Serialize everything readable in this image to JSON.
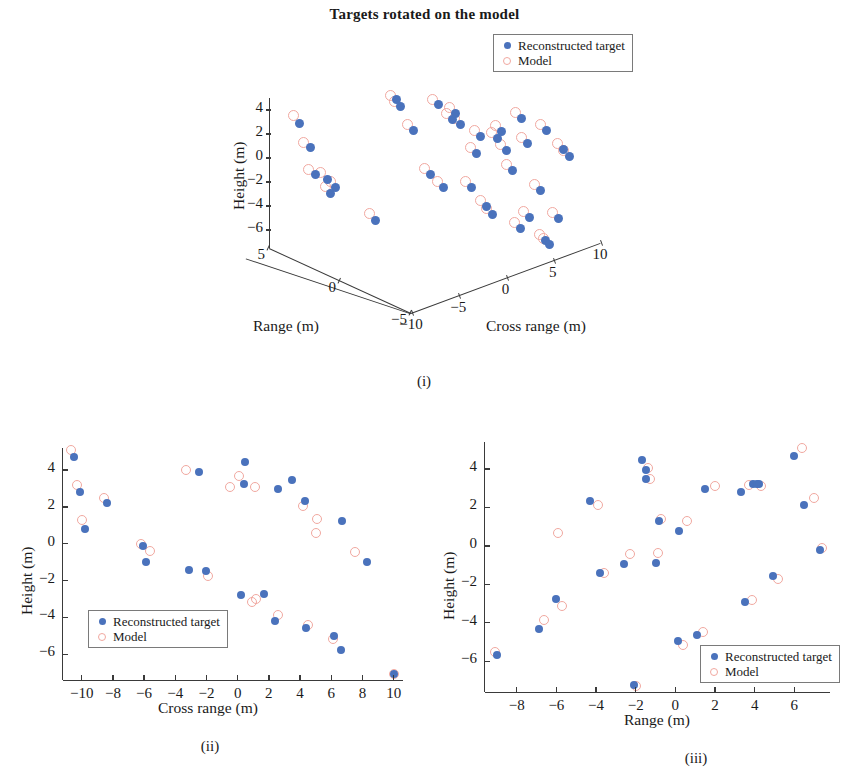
{
  "figure": {
    "title": "Targets rotated on the model"
  },
  "legend": {
    "recon_label": "Reconstructed target",
    "model_label": "Model",
    "recon_color": "#4a72bc",
    "model_color": "#f1a8a0"
  },
  "captions": {
    "i": "(i)",
    "ii": "(ii)",
    "iii": "(iii)"
  },
  "chart_data": [
    {
      "id": "panel-i",
      "type": "scatter",
      "projection": "3d",
      "title": "Targets rotated on the model",
      "caption": "(i)",
      "xlabel": "Cross range (m)",
      "ylabel": "Range (m)",
      "zlabel": "Height (m)",
      "xticks": [
        -10,
        -5,
        0,
        5,
        10
      ],
      "xticklabels": [
        "-10",
        "-5",
        "0",
        "5",
        "10"
      ],
      "yticks": [
        -5,
        0,
        5
      ],
      "yticklabels": [
        "-5",
        "0",
        "5"
      ],
      "zticks": [
        -6,
        -4,
        -2,
        0,
        2,
        4
      ],
      "zticklabels": [
        "-6",
        "-4",
        "-2",
        "0",
        "2",
        "4"
      ],
      "xlim": [
        -11,
        11
      ],
      "ylim": [
        -7,
        7
      ],
      "zlim": [
        -7.5,
        5
      ],
      "grid": false,
      "legend_position": "top-right-outside",
      "series": [
        {
          "name": "Reconstructed target",
          "marker": "filled-circle",
          "color": "#4a72bc",
          "points_px": [
            [
              299,
              123
            ],
            [
              310,
              147
            ],
            [
              315,
              174
            ],
            [
              327,
              179
            ],
            [
              330,
              193
            ],
            [
              335,
              187
            ],
            [
              375,
              220
            ],
            [
              396,
              99
            ],
            [
              400,
              106
            ],
            [
              413,
              130
            ],
            [
              430,
              174
            ],
            [
              438,
              104
            ],
            [
              443,
              187
            ],
            [
              452,
              119
            ],
            [
              455,
              113
            ],
            [
              460,
              124
            ],
            [
              471,
              187
            ],
            [
              476,
              153
            ],
            [
              480,
              136
            ],
            [
              486,
              206
            ],
            [
              492,
              214
            ],
            [
              497,
              138
            ],
            [
              501,
              131
            ],
            [
              506,
              150
            ],
            [
              512,
              170
            ],
            [
              520,
              228
            ],
            [
              521,
              118
            ],
            [
              527,
              143
            ],
            [
              529,
              217
            ],
            [
              540,
              190
            ],
            [
              545,
              240
            ],
            [
              546,
              130
            ],
            [
              549,
              244
            ],
            [
              558,
              218
            ],
            [
              563,
              149
            ],
            [
              569,
              156
            ]
          ]
        },
        {
          "name": "Model",
          "marker": "open-circle",
          "color": "#f1a8a0",
          "points_px": [
            [
              293,
              115
            ],
            [
              303,
              142
            ],
            [
              308,
              169
            ],
            [
              320,
              172
            ],
            [
              325,
              186
            ],
            [
              330,
              181
            ],
            [
              369,
              213
            ],
            [
              390,
              95
            ],
            [
              394,
              101
            ],
            [
              407,
              124
            ],
            [
              424,
              168
            ],
            [
              432,
              99
            ],
            [
              437,
              181
            ],
            [
              446,
              113
            ],
            [
              449,
              107
            ],
            [
              454,
              118
            ],
            [
              465,
              181
            ],
            [
              470,
              147
            ],
            [
              474,
              130
            ],
            [
              480,
              200
            ],
            [
              486,
              208
            ],
            [
              491,
              132
            ],
            [
              495,
              125
            ],
            [
              500,
              144
            ],
            [
              506,
              164
            ],
            [
              514,
              222
            ],
            [
              515,
              112
            ],
            [
              521,
              137
            ],
            [
              523,
              211
            ],
            [
              534,
              184
            ],
            [
              539,
              234
            ],
            [
              540,
              124
            ],
            [
              543,
              238
            ],
            [
              552,
              212
            ],
            [
              557,
              143
            ],
            [
              563,
              150
            ]
          ]
        }
      ]
    },
    {
      "id": "panel-ii",
      "type": "scatter",
      "projection": "2d",
      "caption": "(ii)",
      "xlabel": "Cross range (m)",
      "ylabel": "Height (m)",
      "xticks": [
        -10,
        -8,
        -6,
        -4,
        -2,
        0,
        2,
        4,
        6,
        8,
        10
      ],
      "xticklabels": [
        "-10",
        "-8",
        "-6",
        "-4",
        "-2",
        "0",
        "2",
        "4",
        "6",
        "8",
        "10"
      ],
      "yticks": [
        -6,
        -4,
        -2,
        0,
        2,
        4
      ],
      "yticklabels": [
        "-6",
        "-4",
        "-2",
        "0",
        "2",
        "4"
      ],
      "xlim": [
        -11.2,
        10.6
      ],
      "ylim": [
        -7.4,
        5.2
      ],
      "grid": false,
      "legend_position": "lower-left-inside",
      "series": [
        {
          "name": "Reconstructed target",
          "marker": "filled-circle",
          "color": "#4a72bc",
          "points": [
            [
              -10.5,
              4.7
            ],
            [
              -10.1,
              2.8
            ],
            [
              -9.8,
              0.8
            ],
            [
              -8.4,
              2.2
            ],
            [
              -6.1,
              -0.1
            ],
            [
              -5.9,
              -1.0
            ],
            [
              -3.1,
              -1.4
            ],
            [
              -2.5,
              3.9
            ],
            [
              -2.0,
              -1.5
            ],
            [
              0.2,
              -2.8
            ],
            [
              0.4,
              3.25
            ],
            [
              0.5,
              4.45
            ],
            [
              1.7,
              -2.75
            ],
            [
              2.4,
              -4.2
            ],
            [
              2.6,
              2.95
            ],
            [
              3.5,
              3.45
            ],
            [
              4.3,
              2.3
            ],
            [
              4.4,
              -4.6
            ],
            [
              6.2,
              -5.0
            ],
            [
              6.6,
              -5.75
            ],
            [
              6.7,
              1.25
            ],
            [
              8.3,
              -1.0
            ],
            [
              10.0,
              -7.1
            ]
          ]
        },
        {
          "name": "Model",
          "marker": "open-circle",
          "color": "#f1a8a0",
          "points": [
            [
              -10.7,
              5.1
            ],
            [
              -10.3,
              3.2
            ],
            [
              -10.0,
              1.3
            ],
            [
              -8.6,
              2.5
            ],
            [
              -6.2,
              0.0
            ],
            [
              -5.6,
              -0.4
            ],
            [
              -3.3,
              4.0
            ],
            [
              -1.9,
              -1.75
            ],
            [
              -0.5,
              3.1
            ],
            [
              0.1,
              3.7
            ],
            [
              0.9,
              -3.15
            ],
            [
              1.1,
              3.1
            ],
            [
              1.2,
              -3.0
            ],
            [
              2.6,
              -3.85
            ],
            [
              4.2,
              2.05
            ],
            [
              4.5,
              -4.4
            ],
            [
              5.0,
              0.6
            ],
            [
              5.1,
              1.35
            ],
            [
              6.1,
              -5.2
            ],
            [
              7.5,
              -0.45
            ],
            [
              10.0,
              -7.1
            ]
          ]
        }
      ]
    },
    {
      "id": "panel-iii",
      "type": "scatter",
      "projection": "2d",
      "caption": "(iii)",
      "xlabel": "Range (m)",
      "ylabel": "Height (m)",
      "xticks": [
        -8,
        -6,
        -4,
        -2,
        0,
        2,
        4,
        6
      ],
      "xticklabels": [
        "-8",
        "-6",
        "-4",
        "-2",
        "0",
        "2",
        "4",
        "6"
      ],
      "yticks": [
        -6,
        -4,
        -2,
        0,
        2,
        4
      ],
      "yticklabels": [
        "-6",
        "-4",
        "-2",
        "0",
        "2",
        "4"
      ],
      "xlim": [
        -9.6,
        7.8
      ],
      "ylim": [
        -7.6,
        5.4
      ],
      "grid": false,
      "legend_position": "lower-right-inside",
      "series": [
        {
          "name": "Reconstructed target",
          "marker": "filled-circle",
          "color": "#4a72bc",
          "points": [
            [
              -9.0,
              -5.65
            ],
            [
              -6.9,
              -4.3
            ],
            [
              -6.0,
              -2.75
            ],
            [
              -4.3,
              2.35
            ],
            [
              -3.8,
              -1.4
            ],
            [
              -2.6,
              -0.95
            ],
            [
              -2.1,
              -7.25
            ],
            [
              -1.7,
              4.45
            ],
            [
              -1.5,
              3.95
            ],
            [
              -1.5,
              3.5
            ],
            [
              -1.0,
              -0.9
            ],
            [
              -0.8,
              1.3
            ],
            [
              0.15,
              -4.95
            ],
            [
              0.2,
              0.75
            ],
            [
              1.1,
              -4.65
            ],
            [
              1.5,
              2.95
            ],
            [
              3.3,
              2.8
            ],
            [
              3.5,
              -2.9
            ],
            [
              3.9,
              3.2
            ],
            [
              4.1,
              3.2
            ],
            [
              4.2,
              3.2
            ],
            [
              4.9,
              -1.55
            ],
            [
              6.0,
              4.65
            ],
            [
              6.5,
              2.15
            ],
            [
              7.3,
              -0.2
            ]
          ]
        },
        {
          "name": "Model",
          "marker": "open-circle",
          "color": "#f1a8a0",
          "points": [
            [
              -9.1,
              -5.5
            ],
            [
              -6.6,
              -3.85
            ],
            [
              -5.7,
              -3.15
            ],
            [
              -5.9,
              0.65
            ],
            [
              -3.9,
              2.1
            ],
            [
              -3.6,
              -1.4
            ],
            [
              -2.3,
              -0.4
            ],
            [
              -2.0,
              -7.3
            ],
            [
              -1.4,
              4.05
            ],
            [
              -1.3,
              3.5
            ],
            [
              -0.9,
              -0.35
            ],
            [
              -0.7,
              1.4
            ],
            [
              0.4,
              -5.15
            ],
            [
              0.6,
              1.3
            ],
            [
              1.4,
              -4.5
            ],
            [
              2.0,
              3.1
            ],
            [
              3.7,
              3.15
            ],
            [
              3.85,
              -2.8
            ],
            [
              4.3,
              3.1
            ],
            [
              5.2,
              -1.7
            ],
            [
              6.4,
              5.1
            ],
            [
              7.0,
              2.5
            ],
            [
              7.4,
              -0.1
            ]
          ]
        }
      ]
    }
  ]
}
